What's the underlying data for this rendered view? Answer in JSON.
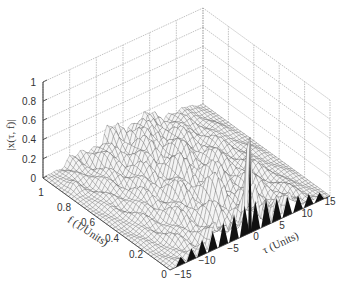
{
  "chart_data": {
    "type": "surface3d",
    "title": "",
    "xlabel": "τ (Units)",
    "ylabel": "f (1/Units)",
    "zlabel": "|x(τ, f)|",
    "x_ticks": [
      "−15",
      "−10",
      "−5",
      "0",
      "5",
      "10",
      "15"
    ],
    "y_ticks": [
      "0",
      "0.2",
      "0.4",
      "0.6",
      "0.8",
      "1"
    ],
    "z_ticks": [
      "0",
      "0.2",
      "0.4",
      "0.6",
      "0.8",
      "1"
    ],
    "xlim": [
      -15,
      15
    ],
    "ylim": [
      0,
      1
    ],
    "zlim": [
      0,
      1
    ],
    "grid": true,
    "colormap": "mesh, white faces, dark edges",
    "features": [
      {
        "description": "sharp peak at tau=0, f=0",
        "tau": 0,
        "f": 0,
        "z": 1.0
      },
      {
        "description": "secondary peak near tau=-14, f=0.85",
        "tau": -14,
        "f": 0.85,
        "z": 0.6
      },
      {
        "description": "background ripple level",
        "z_range": [
          0.05,
          0.35
        ]
      },
      {
        "description": "triangular lobes along f=0 edge at integer tau multiples",
        "tau_values": [
          -13,
          -11,
          -9,
          -7,
          -5,
          -3,
          3,
          5,
          7,
          9,
          11,
          13
        ],
        "z_approx": 0.3
      }
    ]
  },
  "axes": {
    "z_axis_label": "|x(τ, f)|",
    "f_axis_label": "f (1/Units)",
    "tau_axis_label": "τ (Units)"
  }
}
